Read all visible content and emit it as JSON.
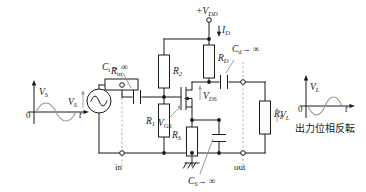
{
  "figure": {
    "type": "circuit-schematic",
    "colors": {
      "wire": "#1a1a1a",
      "dashed_guide": "#b0b0b0",
      "leader": "#8c8c8c",
      "waveform": "#9a9a9a",
      "background": "#ffffff"
    }
  },
  "input_plot": {
    "y_axis_label": "V",
    "y_axis_sub": "S",
    "x_axis_label": "t",
    "origin_label": "0",
    "waveform": "sine, positive half first then negative half",
    "phase": "reference"
  },
  "output_plot": {
    "y_axis_label": "V",
    "y_axis_sub": "L",
    "x_axis_label": "t",
    "origin_label": "0",
    "waveform": "sine, negative half first then positive half",
    "phase": "inverted",
    "caption": "出力位相反転"
  },
  "source": {
    "name": "V",
    "sub": "S",
    "symbol": "ac-source"
  },
  "components": {
    "r_in": {
      "label": "R",
      "sub": "in"
    },
    "r_1": {
      "label": "R",
      "sub": "1"
    },
    "r_2": {
      "label": "R",
      "sub": "2"
    },
    "r_d": {
      "label": "R",
      "sub": "D"
    },
    "r_s": {
      "label": "R",
      "sub": "S"
    },
    "r_l": {
      "label": "R",
      "sub": "L"
    },
    "c_i": {
      "label": "C",
      "sub": "i",
      "value": "→ ∞"
    },
    "c_d": {
      "label": "C",
      "sub": "d",
      "value": "→ ∞"
    },
    "c_s": {
      "label": "C",
      "sub": "S",
      "value": "→ ∞"
    }
  },
  "supply": {
    "label": "+V",
    "sub": "DD",
    "current": {
      "label": "I",
      "sub": "D"
    }
  },
  "transistor": {
    "type": "n-channel MOSFET",
    "v_ds": {
      "label": "V",
      "sub": "DS"
    },
    "v_gs": {
      "label": "V",
      "sub": "GS"
    }
  },
  "load": {
    "v_l": {
      "label": "V",
      "sub": "L"
    }
  },
  "terminals": {
    "input": "in",
    "output": "out"
  },
  "ground": {
    "symbol": "earth-ground"
  }
}
